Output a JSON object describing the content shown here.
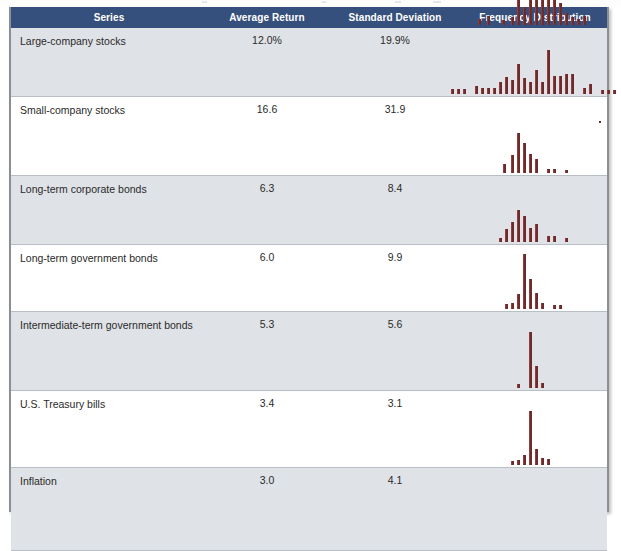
{
  "table": {
    "headers": [
      {
        "key": "series",
        "label": "Series"
      },
      {
        "key": "avg",
        "label": "Average Return"
      },
      {
        "key": "sd",
        "label": "Standard Deviation"
      },
      {
        "key": "freq",
        "label": "Frequency Distribution"
      }
    ],
    "header_bg": "#35507d",
    "header_text_color": "#ffffff",
    "shaded_row_bg": "#dfe2e6",
    "plain_row_bg": "#ffffff",
    "bar_color": "#6d2b2b",
    "border_color": "#8a8f96",
    "rows": [
      {
        "series": "Large-company stocks",
        "avg": "12.0%",
        "sd": "19.9%",
        "height": 62,
        "shaded": true
      },
      {
        "series": "Small-company stocks",
        "avg": "16.6",
        "sd": "31.9",
        "height": 72,
        "shaded": false
      },
      {
        "series": "Long-term corporate bonds",
        "avg": "6.3",
        "sd": "8.4",
        "height": 62,
        "shaded": true
      },
      {
        "series": "Long-term government bonds",
        "avg": "6.0",
        "sd": "9.9",
        "height": 60,
        "shaded": false
      },
      {
        "series": "Intermediate-term government bonds",
        "avg": "5.3",
        "sd": "5.6",
        "height": 72,
        "shaded": true
      },
      {
        "series": "U.S. Treasury bills",
        "avg": "3.4",
        "sd": "3.1",
        "height": 70,
        "shaded": false
      },
      {
        "series": "Inflation",
        "avg": "3.0",
        "sd": "4.1",
        "height": 76,
        "shaded": true
      }
    ]
  },
  "chart_data": [
    {
      "type": "bar",
      "title": "Large-company stocks frequency distribution",
      "xlabel": "Annual return (%)",
      "ylabel": "Frequency",
      "grid": false,
      "legend": "none",
      "ylim": [
        0,
        14
      ],
      "categories": [
        "-90",
        "-80",
        "-70",
        "-60",
        "-50",
        "-40",
        "-30",
        "-20",
        "-10",
        "0",
        "10",
        "20",
        "30",
        "40",
        "50",
        "60",
        "70",
        "80",
        "90",
        "100"
      ],
      "values": [
        0,
        0,
        0,
        0,
        0,
        2,
        0,
        3,
        9,
        6,
        13,
        11,
        12,
        16,
        14,
        16,
        8,
        4,
        3,
        4
      ],
      "bar_left_px": [
        471,
        480,
        495,
        504,
        510,
        516,
        522,
        528,
        534,
        540,
        546,
        552,
        558,
        564,
        570,
        576
      ],
      "bar_heights_px": [
        6,
        9,
        5,
        8,
        26,
        18,
        25,
        30,
        38,
        34,
        36,
        22,
        12,
        8,
        6,
        9
      ]
    },
    {
      "type": "bar",
      "title": "Small-company stocks frequency distribution",
      "xlabel": "Annual return (%)",
      "ylabel": "Frequency",
      "grid": false,
      "legend": "none",
      "ylim": [
        0,
        14
      ],
      "categories": [
        "-90",
        "-80",
        "-70",
        "-60",
        "-50",
        "-40",
        "-30",
        "-20",
        "-10",
        "0",
        "10",
        "20",
        "30",
        "40",
        "50",
        "60",
        "70",
        "80",
        "90",
        "100",
        "110",
        "120",
        "130",
        "140"
      ],
      "values": [
        2,
        2,
        2,
        0,
        4,
        3,
        3,
        3,
        6,
        9,
        7,
        14,
        8,
        6,
        12,
        6,
        20,
        9,
        9,
        10,
        10,
        3,
        4,
        0,
        2,
        2,
        2
      ],
      "bar_left_px": [
        444,
        450,
        456,
        468,
        474,
        480,
        486,
        492,
        498,
        504,
        510,
        516,
        522,
        528,
        534,
        540,
        546,
        552,
        558,
        564,
        576,
        582,
        594,
        600,
        606
      ],
      "bar_heights_px": [
        5,
        5,
        5,
        8,
        6,
        6,
        6,
        12,
        17,
        14,
        30,
        16,
        12,
        24,
        12,
        44,
        18,
        18,
        20,
        20,
        6,
        10,
        4,
        4,
        4
      ]
    },
    {
      "type": "bar",
      "title": "Long-term corporate bonds frequency distribution",
      "xlabel": "Annual return (%)",
      "ylabel": "Frequency",
      "grid": false,
      "legend": "none",
      "ylim": [
        0,
        20
      ],
      "categories": [
        "-10",
        "0",
        "10",
        "20",
        "30",
        "40",
        "50"
      ],
      "values": [
        4,
        12,
        20,
        14,
        13,
        8,
        1,
        1,
        1
      ],
      "bar_left_px": [
        496,
        504,
        510,
        516,
        522,
        528,
        540,
        546,
        558
      ],
      "bar_heights_px": [
        9,
        18,
        40,
        30,
        19,
        14,
        4,
        4,
        3
      ]
    },
    {
      "type": "bar",
      "title": "Long-term government bonds frequency distribution",
      "xlabel": "Annual return (%)",
      "ylabel": "Frequency",
      "grid": false,
      "legend": "none",
      "ylim": [
        0,
        20
      ],
      "categories": [
        "-10",
        "0",
        "10",
        "20",
        "30",
        "40",
        "50"
      ],
      "values": [
        2,
        6,
        11,
        17,
        14,
        7,
        9,
        3,
        3,
        2
      ],
      "bar_left_px": [
        492,
        498,
        504,
        510,
        516,
        522,
        528,
        540,
        546,
        558
      ],
      "bar_heights_px": [
        4,
        13,
        20,
        32,
        26,
        14,
        18,
        6,
        6,
        4
      ]
    },
    {
      "type": "bar",
      "title": "Intermediate-term government bonds frequency distribution",
      "xlabel": "Annual return (%)",
      "ylabel": "Frequency",
      "grid": false,
      "legend": "none",
      "ylim": [
        0,
        30
      ],
      "categories": [
        "-10",
        "0",
        "10",
        "20",
        "30"
      ],
      "values": [
        2,
        4,
        8,
        30,
        16,
        9,
        3,
        2,
        2
      ],
      "bar_left_px": [
        498,
        504,
        510,
        516,
        522,
        528,
        534,
        546,
        552
      ],
      "bar_heights_px": [
        5,
        6,
        15,
        55,
        30,
        16,
        6,
        4,
        4
      ]
    },
    {
      "type": "bar",
      "title": "U.S. Treasury bills frequency distribution",
      "xlabel": "Annual return (%)",
      "ylabel": "Frequency",
      "grid": false,
      "legend": "none",
      "ylim": [
        0,
        35
      ],
      "categories": [
        "0",
        "5",
        "10",
        "15"
      ],
      "values": [
        2,
        35,
        12,
        3
      ],
      "bar_left_px": [
        510,
        522,
        528,
        534
      ],
      "bar_heights_px": [
        4,
        56,
        22,
        5
      ]
    },
    {
      "type": "bar",
      "title": "Inflation frequency distribution",
      "xlabel": "Annual inflation rate (%)",
      "ylabel": "Frequency",
      "grid": false,
      "legend": "none",
      "ylim": [
        0,
        40
      ],
      "categories": [
        "-20",
        "-10",
        "0",
        "10",
        "20"
      ],
      "values": [
        2,
        3,
        6,
        40,
        11,
        4,
        3
      ],
      "bar_left_px": [
        504,
        510,
        516,
        522,
        528,
        534,
        540
      ],
      "bar_heights_px": [
        4,
        5,
        10,
        54,
        16,
        7,
        6
      ]
    }
  ]
}
